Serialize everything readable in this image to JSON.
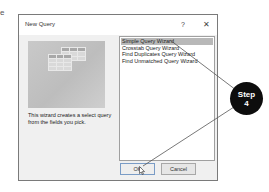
{
  "page": {
    "margin_letter": "e"
  },
  "dialog": {
    "title": "New Query",
    "help_label": "?",
    "close_label": "✕",
    "description": "This wizard creates a select query from the fields you pick.",
    "list": {
      "items": [
        {
          "label": "Simple Query Wizard",
          "selected": true
        },
        {
          "label": "Crosstab Query Wizard",
          "selected": false
        },
        {
          "label": "Find Duplicates Query Wizard",
          "selected": false
        },
        {
          "label": "Find Unmatched Query Wizard",
          "selected": false
        }
      ]
    },
    "buttons": {
      "ok": "OK",
      "cancel": "Cancel"
    }
  },
  "callout": {
    "label": "Step",
    "number": "4",
    "color": "#0d0d0d"
  }
}
